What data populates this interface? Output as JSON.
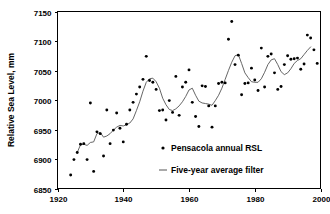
{
  "chart_data": {
    "type": "scatter",
    "title": "",
    "xlabel": "",
    "ylabel": "Relative Sea Level, mm",
    "xlim": [
      1920,
      2000
    ],
    "ylim": [
      6850,
      7150
    ],
    "xticks": [
      1920,
      1940,
      1960,
      1980,
      2000
    ],
    "yticks": [
      6850,
      6900,
      6950,
      7000,
      7050,
      7100,
      7150
    ],
    "grid": false,
    "legend_position": "inside-lower-right",
    "series": [
      {
        "name": "Pensacola annual RSL",
        "type": "scatter",
        "marker": "dot",
        "color": "#000000",
        "x": [
          1924,
          1925,
          1926,
          1927,
          1928,
          1929,
          1930,
          1931,
          1932,
          1933,
          1934,
          1935,
          1936,
          1937,
          1938,
          1939,
          1940,
          1941,
          1942,
          1943,
          1944,
          1945,
          1946,
          1947,
          1948,
          1949,
          1950,
          1951,
          1952,
          1953,
          1954,
          1955,
          1956,
          1957,
          1958,
          1959,
          1960,
          1961,
          1962,
          1963,
          1964,
          1965,
          1966,
          1967,
          1968,
          1969,
          1970,
          1971,
          1972,
          1973,
          1974,
          1975,
          1976,
          1977,
          1978,
          1979,
          1980,
          1981,
          1982,
          1983,
          1984,
          1985,
          1986,
          1987,
          1988,
          1989,
          1990,
          1991,
          1992,
          1993,
          1994,
          1995,
          1996,
          1997,
          1998,
          1999
        ],
        "y": [
          6873,
          6899,
          6911,
          6925,
          6926,
          6899,
          6995,
          6879,
          6946,
          6943,
          6905,
          6983,
          6926,
          6949,
          6978,
          6952,
          6929,
          6959,
          6983,
          6996,
          7010,
          7022,
          7035,
          7074,
          7033,
          7030,
          7018,
          6982,
          6983,
          6966,
          6999,
          6979,
          7040,
          6974,
          7022,
          7030,
          7051,
          6996,
          6972,
          6955,
          7024,
          7023,
          6990,
          6954,
          6990,
          7028,
          7030,
          7029,
          7103,
          7133,
          7060,
          7076,
          7009,
          7028,
          7029,
          7054,
          7034,
          7016,
          7088,
          7022,
          7074,
          7078,
          7046,
          7018,
          7023,
          7060,
          7075,
          7069,
          7070,
          7071,
          7052,
          7061,
          7110,
          7105,
          7085,
          7062
        ]
      },
      {
        "name": "Five-year average filter",
        "type": "line",
        "color": "#555555",
        "x": [
          1926,
          1927,
          1928,
          1929,
          1930,
          1931,
          1932,
          1933,
          1934,
          1935,
          1936,
          1937,
          1938,
          1939,
          1940,
          1941,
          1942,
          1943,
          1944,
          1945,
          1946,
          1947,
          1948,
          1949,
          1950,
          1951,
          1952,
          1953,
          1954,
          1955,
          1956,
          1957,
          1958,
          1959,
          1960,
          1961,
          1962,
          1963,
          1964,
          1965,
          1966,
          1967,
          1968,
          1969,
          1970,
          1971,
          1972,
          1973,
          1974,
          1975,
          1976,
          1977,
          1978,
          1979,
          1980,
          1981,
          1982,
          1983,
          1984,
          1985,
          1986,
          1987,
          1988,
          1989,
          1990,
          1991,
          1992,
          1993,
          1994,
          1995,
          1996,
          1997
        ],
        "y": [
          6911,
          6924,
          6925,
          6923,
          6928,
          6929,
          6943,
          6945,
          6937,
          6939,
          6943,
          6949,
          6954,
          6957,
          6956,
          6958,
          6961,
          6968,
          6982,
          6997,
          7015,
          7030,
          7036,
          7037,
          7031,
          7020,
          7003,
          6992,
          6984,
          6982,
          6985,
          6990,
          6997,
          7006,
          7017,
          7020,
          7008,
          6998,
          6995,
          6994,
          6993,
          6991,
          6999,
          7008,
          7020,
          7035,
          7050,
          7064,
          7075,
          7077,
          7062,
          7046,
          7038,
          7031,
          7030,
          7030,
          7036,
          7047,
          7060,
          7068,
          7070,
          7060,
          7048,
          7043,
          7046,
          7053,
          7062,
          7067,
          7070,
          7077,
          7084,
          7090
        ]
      }
    ],
    "legend": [
      {
        "label": "Pensacola annual RSL",
        "marker": "dot"
      },
      {
        "label": "Five-year average filter",
        "marker": "line"
      }
    ]
  }
}
